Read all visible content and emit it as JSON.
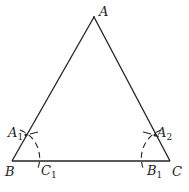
{
  "diagram": {
    "type": "geometric-construction",
    "stroke_color": "#222222",
    "background": "#ffffff",
    "points": {
      "A": {
        "label": "A",
        "sub": ""
      },
      "B": {
        "label": "B",
        "sub": ""
      },
      "C": {
        "label": "C",
        "sub": ""
      },
      "A1": {
        "label": "A",
        "sub": "1"
      },
      "A2": {
        "label": "A",
        "sub": "2"
      },
      "B1": {
        "label": "B",
        "sub": "1"
      },
      "C1": {
        "label": "C",
        "sub": "1"
      }
    },
    "segments": [
      "AB",
      "AC",
      "BC"
    ],
    "arcs": [
      {
        "center": "B",
        "through": [
          "A1",
          "C1"
        ],
        "style": "dashed"
      },
      {
        "center": "C",
        "through": [
          "A2",
          "B1"
        ],
        "style": "dashed"
      }
    ]
  }
}
